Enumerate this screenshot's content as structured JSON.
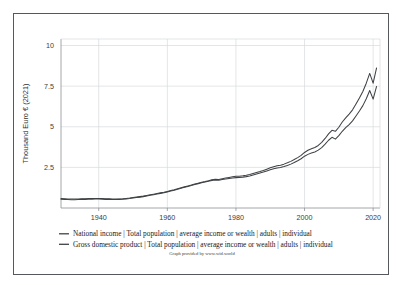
{
  "axes": {
    "y_title": "Thousand Euro € (2021)",
    "y_ticks": [
      "2.5",
      "5",
      "7.5",
      "10"
    ],
    "y_tick_values": [
      2.5,
      5,
      7.5,
      10
    ],
    "x_ticks": [
      "1940",
      "1960",
      "1980",
      "2000",
      "2020"
    ],
    "x_tick_values": [
      1940,
      1960,
      1980,
      2000,
      2020
    ]
  },
  "legend": {
    "entries": [
      {
        "label": "National income | Total population | average income or wealth | adults | individual",
        "color": "#3f4346"
      },
      {
        "label": "Gross domestic product | Total population | average income or wealth | adults | individual",
        "color": "#3f4346"
      }
    ]
  },
  "credit": "Graph provided by www.wid.world",
  "colors": {
    "frame_border": "#55585c",
    "gridline": "#d9dadc",
    "axis": "#8e9195",
    "line_national_income": "#3f4346",
    "line_gdp": "#3f4346",
    "background": "#ffffff",
    "text": "#17191b"
  },
  "chart_data": {
    "type": "line",
    "title": "",
    "xlabel": "",
    "ylabel": "Thousand Euro € (2021)",
    "xlim": [
      1929,
      2022
    ],
    "ylim": [
      0,
      10.4
    ],
    "grid": true,
    "legend_position": "bottom",
    "x": [
      1929,
      1930,
      1931,
      1932,
      1933,
      1934,
      1935,
      1936,
      1937,
      1938,
      1939,
      1940,
      1941,
      1942,
      1943,
      1944,
      1945,
      1946,
      1947,
      1948,
      1949,
      1950,
      1951,
      1952,
      1953,
      1954,
      1955,
      1956,
      1957,
      1958,
      1959,
      1960,
      1961,
      1962,
      1963,
      1964,
      1965,
      1966,
      1967,
      1968,
      1969,
      1970,
      1971,
      1972,
      1973,
      1974,
      1975,
      1976,
      1977,
      1978,
      1979,
      1980,
      1981,
      1982,
      1983,
      1984,
      1985,
      1986,
      1987,
      1988,
      1989,
      1990,
      1991,
      1992,
      1993,
      1994,
      1995,
      1996,
      1997,
      1998,
      1999,
      2000,
      2001,
      2002,
      2003,
      2004,
      2005,
      2006,
      2007,
      2008,
      2009,
      2010,
      2011,
      2012,
      2013,
      2014,
      2015,
      2016,
      2017,
      2018,
      2019,
      2020,
      2021
    ],
    "series": [
      {
        "name": "Gross domestic product | Total population | average income or wealth | adults | individual",
        "values": [
          0.58,
          0.57,
          0.56,
          0.55,
          0.55,
          0.56,
          0.57,
          0.57,
          0.58,
          0.58,
          0.59,
          0.59,
          0.58,
          0.57,
          0.57,
          0.56,
          0.55,
          0.56,
          0.57,
          0.59,
          0.61,
          0.64,
          0.67,
          0.7,
          0.73,
          0.77,
          0.81,
          0.85,
          0.89,
          0.93,
          0.97,
          1.02,
          1.07,
          1.12,
          1.18,
          1.24,
          1.3,
          1.36,
          1.41,
          1.47,
          1.53,
          1.59,
          1.63,
          1.68,
          1.74,
          1.77,
          1.76,
          1.8,
          1.84,
          1.88,
          1.92,
          1.95,
          1.96,
          1.98,
          2.01,
          2.06,
          2.12,
          2.18,
          2.24,
          2.31,
          2.39,
          2.47,
          2.54,
          2.6,
          2.63,
          2.7,
          2.78,
          2.87,
          2.98,
          3.1,
          3.24,
          3.42,
          3.55,
          3.64,
          3.72,
          3.85,
          4.04,
          4.28,
          4.56,
          4.78,
          4.72,
          4.97,
          5.29,
          5.55,
          5.78,
          6.04,
          6.4,
          6.77,
          7.17,
          7.68,
          8.28,
          7.68,
          8.62
        ]
      },
      {
        "name": "National income | Total population | average income or wealth | adults | individual",
        "values": [
          0.54,
          0.53,
          0.52,
          0.51,
          0.51,
          0.52,
          0.53,
          0.53,
          0.54,
          0.54,
          0.55,
          0.55,
          0.54,
          0.53,
          0.53,
          0.52,
          0.52,
          0.53,
          0.54,
          0.56,
          0.58,
          0.61,
          0.64,
          0.67,
          0.7,
          0.74,
          0.78,
          0.82,
          0.86,
          0.9,
          0.94,
          0.99,
          1.04,
          1.09,
          1.15,
          1.21,
          1.27,
          1.33,
          1.38,
          1.44,
          1.5,
          1.56,
          1.6,
          1.65,
          1.7,
          1.72,
          1.71,
          1.75,
          1.78,
          1.82,
          1.85,
          1.87,
          1.88,
          1.9,
          1.93,
          1.97,
          2.03,
          2.09,
          2.15,
          2.21,
          2.28,
          2.35,
          2.41,
          2.46,
          2.49,
          2.55,
          2.62,
          2.7,
          2.8,
          2.91,
          3.03,
          3.19,
          3.3,
          3.38,
          3.45,
          3.56,
          3.72,
          3.93,
          4.17,
          4.35,
          4.24,
          4.45,
          4.72,
          4.94,
          5.13,
          5.36,
          5.66,
          5.97,
          6.3,
          6.72,
          7.23,
          6.7,
          7.48
        ]
      }
    ]
  }
}
